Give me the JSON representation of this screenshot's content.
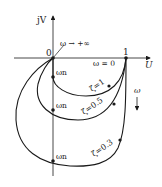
{
  "axes": {
    "vertical_label": "jV",
    "horizontal_label": "U",
    "origin_label": "0",
    "unit_label": "1"
  },
  "annotations": {
    "omega_infinity": "ω → +∞",
    "omega_zero": "ω = 0",
    "omega_direction": "ω",
    "omega_n_1": "ωn",
    "omega_n_2": "ωn",
    "omega_n_3": "ωn"
  },
  "curves": [
    {
      "zeta_label": "ζ=1",
      "zeta": 1
    },
    {
      "zeta_label": "ζ=0.5",
      "zeta": 0.5
    },
    {
      "zeta_label": "ζ=0.3",
      "zeta": 0.3
    }
  ],
  "colors": {
    "line": "#1a1a1a",
    "background": "#ffffff"
  }
}
